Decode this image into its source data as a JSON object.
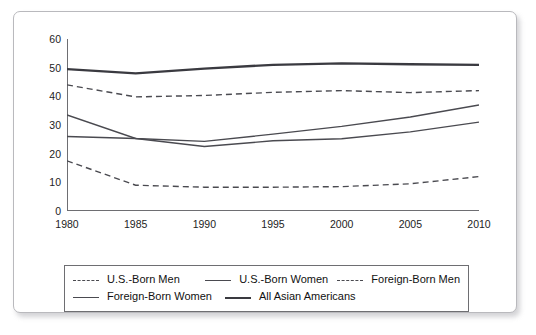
{
  "chart_data": {
    "type": "line",
    "title": "",
    "subtitle": "",
    "xlabel": "",
    "ylabel": "",
    "x": [
      1980,
      1985,
      1990,
      1995,
      2000,
      2005,
      2010
    ],
    "xtick_labels": [
      "1980",
      "1985",
      "1990",
      "1995",
      "2000",
      "2005",
      "2010"
    ],
    "ytick_labels": [
      "0",
      "10",
      "20",
      "30",
      "40",
      "50",
      "60"
    ],
    "yticks": [
      0,
      10,
      20,
      30,
      40,
      50,
      60
    ],
    "xlim": [
      1980,
      2010
    ],
    "ylim": [
      0,
      60
    ],
    "grid": false,
    "legend_position": "bottom",
    "series": [
      {
        "name": "U.S.-Born Men",
        "style": "dashed",
        "width": 1.4,
        "color": "#4a4a50",
        "values": [
          17.5,
          9.0,
          8.3,
          8.3,
          8.5,
          9.5,
          12.0
        ]
      },
      {
        "name": "U.S.-Born Women",
        "style": "solid",
        "width": 1.4,
        "color": "#4a4a50",
        "values": [
          33.5,
          25.3,
          24.3,
          26.8,
          29.5,
          32.8,
          37.0
        ]
      },
      {
        "name": "Foreign-Born Men",
        "style": "dashed",
        "width": 1.4,
        "color": "#4a4a50",
        "values": [
          44.0,
          39.8,
          40.3,
          41.4,
          42.0,
          41.3,
          42.0
        ]
      },
      {
        "name": "Foreign-Born Women",
        "style": "solid",
        "width": 1.4,
        "color": "#4a4a50",
        "values": [
          26.0,
          25.3,
          22.5,
          24.5,
          25.2,
          27.6,
          31.0
        ]
      },
      {
        "name": "All Asian Americans",
        "style": "solid-thick",
        "width": 2.3,
        "color": "#3a3a40",
        "values": [
          49.5,
          48.0,
          49.7,
          51.0,
          51.5,
          51.2,
          51.0
        ]
      }
    ]
  },
  "legend": {
    "rows": [
      [
        {
          "label": "U.S.-Born Men",
          "style": "dashed"
        },
        {
          "label": "U.S.-Born Women",
          "style": "solid"
        },
        {
          "label": "Foreign-Born Men",
          "style": "dashed"
        }
      ],
      [
        {
          "label": "Foreign-Born Women",
          "style": "solid"
        },
        {
          "label": "All Asian Americans",
          "style": "solid-thick"
        }
      ]
    ]
  },
  "colors": {
    "axis": "#6e6e72",
    "line": "#4a4a50",
    "line_emphasis": "#3a3a40",
    "text": "#111111",
    "card_border": "#b9b9bd",
    "legend_border": "#6e6e72",
    "background": "#ffffff"
  }
}
